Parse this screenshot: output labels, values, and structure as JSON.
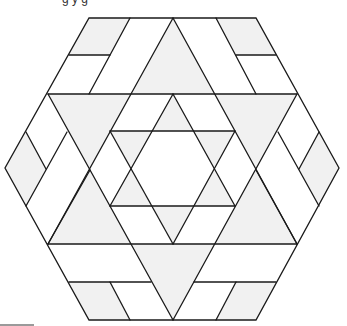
{
  "figure": {
    "caption_cropped": "g              y  g",
    "shape": "hexagon",
    "colors": {
      "stroke": "#1a1a1a",
      "shade": "#f1f1f1",
      "background": "#ffffff"
    }
  }
}
